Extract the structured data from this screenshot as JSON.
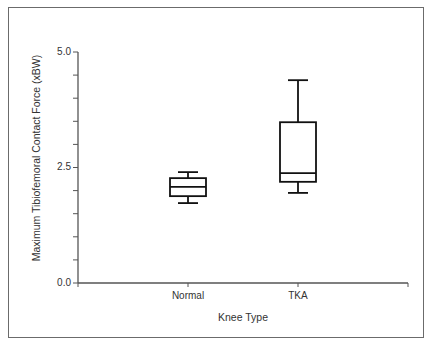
{
  "chart_data": {
    "type": "box",
    "title": "",
    "xlabel": "Knee Type",
    "ylabel": "Maximum Tibiofemoral Contact Force (xBW)",
    "ylim": [
      0.0,
      5.0
    ],
    "yticks": [
      "0.0",
      "2.5",
      "5.0"
    ],
    "yminor_step": 0.5,
    "categories": [
      "Normal",
      "TKA"
    ],
    "series": [
      {
        "name": "Normal",
        "min": 1.73,
        "q1": 1.88,
        "median": 2.08,
        "q3": 2.27,
        "max": 2.4
      },
      {
        "name": "TKA",
        "min": 1.95,
        "q1": 2.19,
        "median": 2.38,
        "q3": 3.48,
        "max": 4.39
      }
    ],
    "grid": false,
    "legend": null
  },
  "labels": {
    "xlabel": "Knee Type",
    "ylabel": "Maximum Tibiofemoral Contact Force (xBW)",
    "ytick_0": "0.0",
    "ytick_1": "2.5",
    "ytick_2": "5.0",
    "cat_0": "Normal",
    "cat_1": "TKA"
  },
  "colors": {
    "axis": "#555555",
    "box": "#111111",
    "frame": "#6b6b6b"
  }
}
